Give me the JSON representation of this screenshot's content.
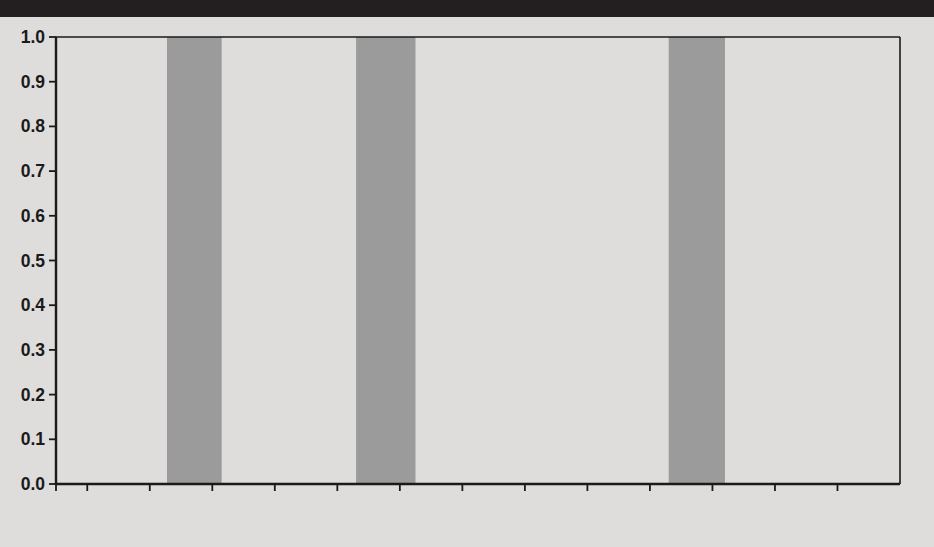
{
  "page": {
    "background_color": "#d9d9d7",
    "banner_color": "#231f20",
    "banner_label": ""
  },
  "chart_data": {
    "type": "line",
    "title": "",
    "subtitle": "",
    "xlabel": "",
    "ylabel": "",
    "xlim": [
      1970,
      1997
    ],
    "ylim": [
      0.0,
      1.0
    ],
    "grid": false,
    "legend_position": "inside-center-bottom",
    "y_ticks": [
      "0.0",
      "0.1",
      "0.2",
      "0.3",
      "0.4",
      "0.5",
      "0.6",
      "0.7",
      "0.8",
      "0.9",
      "1.0"
    ],
    "y_tick_values": [
      0.0,
      0.1,
      0.2,
      0.3,
      0.4,
      0.5,
      0.6,
      0.7,
      0.8,
      0.9,
      1.0
    ],
    "x_ticks_labeled": [
      "1970",
      "1972",
      "1974",
      "1976",
      "1978",
      "1980",
      "1982",
      "1984",
      "1986",
      "1988",
      "1990",
      "1992",
      "1994",
      "1996"
    ],
    "x_tick_values_labeled": [
      1970,
      1972,
      1974,
      1976,
      1978,
      1980,
      1982,
      1984,
      1986,
      1988,
      1990,
      1992,
      1994,
      1996
    ],
    "x_minor_tick_values": [
      1971,
      1973,
      1975,
      1977,
      1979,
      1981,
      1983,
      1985,
      1987,
      1989,
      1991,
      1993,
      1995
    ],
    "x": [
      1970,
      1971,
      1972,
      1973,
      1974,
      1975,
      1976,
      1977,
      1978,
      1979,
      1980,
      1981,
      1982,
      1983,
      1984,
      1985,
      1986,
      1987,
      1988,
      1989,
      1990,
      1991,
      1992,
      1993,
      1994,
      1995,
      1996,
      1997
    ],
    "series": [
      {
        "name": "Male",
        "color": "#2e2e2e",
        "values": [
          0.925,
          0.918,
          0.91,
          0.913,
          0.912,
          0.905,
          0.9,
          0.899,
          0.899,
          0.898,
          0.892,
          0.886,
          0.88,
          0.861,
          0.864,
          0.871,
          0.865,
          0.858,
          0.852,
          0.846,
          0.84,
          0.832,
          0.823,
          0.821,
          0.818,
          0.816,
          0.81,
          0.805
        ]
      },
      {
        "name": "Female",
        "color": "#7c7c7c",
        "values": [
          0.508,
          0.508,
          0.512,
          0.52,
          0.53,
          0.537,
          0.54,
          0.546,
          0.553,
          0.561,
          0.568,
          0.573,
          0.569,
          0.562,
          0.572,
          0.583,
          0.594,
          0.606,
          0.618,
          0.626,
          0.628,
          0.627,
          0.63,
          0.632,
          0.637,
          0.639,
          0.644,
          0.652
        ]
      }
    ],
    "recession_bands": [
      {
        "label": "Recession",
        "start": 1973.55,
        "end": 1975.3
      },
      {
        "label": "Recession",
        "start": 1979.6,
        "end": 1981.5
      },
      {
        "label": "Recession",
        "start": 1989.6,
        "end": 1991.4
      }
    ],
    "recession_color": "#9b9b9b",
    "legend": [
      {
        "label": "Recession",
        "type": "band",
        "color": "#9b9b9b"
      },
      {
        "label": "Male",
        "type": "line",
        "color": "#2e2e2e"
      },
      {
        "label": "Female",
        "type": "line",
        "color": "#7c7c7c"
      }
    ]
  }
}
